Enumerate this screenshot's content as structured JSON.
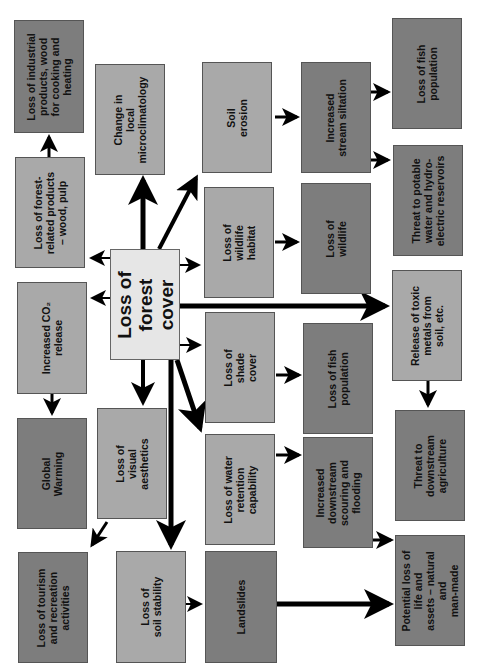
{
  "diagram": {
    "colors": {
      "center": "#e6e6e6",
      "light": "#a9a9a9",
      "dark": "#7d7d7d",
      "arrow": "#000000"
    },
    "center": {
      "text": "Loss of\nforest\ncover"
    },
    "boxes": {
      "industrial": "Loss of industrial\nproducts, wood\nfor cooking and\nheating",
      "microclimate": "Change in\nlocal\nmicroclimatology",
      "forest_products": "Loss of forest-\nrelated products\n– wood, pulp",
      "soil_erosion": "Soil\nerosion",
      "stream_siltation": "Increased\nstream siltation",
      "fish_top": "Loss of fish\npopulation",
      "potable_water": "Threat to potable\nwater and hydro-\nelectric reservoirs",
      "wildlife_habitat": "Loss of\nwildlife\nhabitat",
      "wildlife": "Loss of\nwildlife",
      "co2": "Increased CO₂\nrelease",
      "toxic_metals": "Release of toxic\nmetals from\nsoil, etc.",
      "shade_cover": "Loss of\nshade\ncover",
      "fish_mid": "Loss of fish\npopulation",
      "global_warming": "Global\nWarming",
      "visual_aesthetics": "Loss of\nvisual\naesthetics",
      "water_retention": "Loss of water\nretention\ncapability",
      "scouring_flooding": "Increased\ndownstream\nscouring and\nflooding",
      "agriculture": "Threat to\ndownstream\nagriculture",
      "tourism": "Loss of tourism\nand recreation\nactivities",
      "soil_stability": "Loss of\nsoil stability",
      "landslides": "Landslides",
      "life_assets": "Potential loss of\nlife and\nassets – natural\nand\nman-made"
    }
  }
}
